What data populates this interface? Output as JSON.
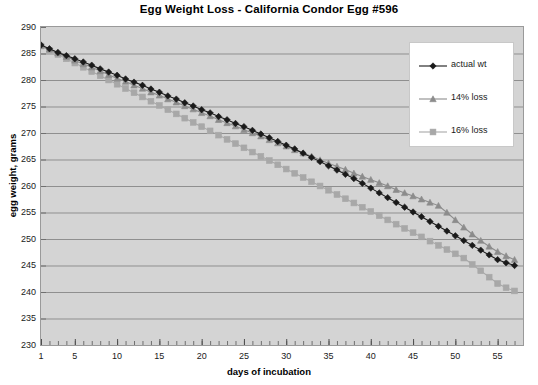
{
  "chart_data": {
    "type": "line",
    "title": "Egg Weight Loss - California Condor Egg #596",
    "xlabel": "days of incubation",
    "ylabel": "egg weight, grams",
    "xlim": [
      1,
      58
    ],
    "ylim": [
      230,
      290
    ],
    "xticks": [
      1,
      5,
      10,
      15,
      20,
      25,
      30,
      35,
      40,
      45,
      50,
      55
    ],
    "yticks": [
      230,
      235,
      240,
      245,
      250,
      255,
      260,
      265,
      270,
      275,
      280,
      285,
      290
    ],
    "grid": "horizontal",
    "legend_position": "upper-right",
    "x": [
      1,
      2,
      3,
      4,
      5,
      6,
      7,
      8,
      9,
      10,
      11,
      12,
      13,
      14,
      15,
      16,
      17,
      18,
      19,
      20,
      21,
      22,
      23,
      24,
      25,
      26,
      27,
      28,
      29,
      30,
      31,
      32,
      33,
      34,
      35,
      36,
      37,
      38,
      39,
      40,
      41,
      42,
      43,
      44,
      45,
      46,
      47,
      48,
      49,
      50,
      51,
      52,
      53,
      54,
      55,
      56,
      57
    ],
    "series": [
      {
        "name": "actual wt",
        "marker": "diamond",
        "color": "#1a1a1a",
        "values": [
          286.6,
          285.9,
          285.2,
          284.6,
          284.0,
          283.4,
          282.8,
          282.1,
          281.5,
          280.9,
          280.2,
          279.6,
          279.0,
          278.3,
          277.7,
          277.0,
          276.4,
          275.7,
          275.1,
          274.4,
          273.8,
          273.1,
          272.5,
          271.8,
          271.2,
          270.5,
          269.8,
          269.1,
          268.4,
          267.7,
          267.0,
          266.2,
          265.4,
          264.6,
          263.8,
          263.0,
          262.2,
          261.4,
          260.5,
          259.6,
          258.7,
          257.8,
          256.9,
          256.0,
          255.1,
          254.2,
          253.3,
          252.4,
          251.5,
          250.6,
          249.7,
          248.8,
          247.9,
          247.0,
          246.1,
          245.5,
          245.0
        ]
      },
      {
        "name": "14% loss",
        "marker": "triangle",
        "color": "#8c8c8c",
        "values": [
          286.5,
          285.8,
          285.1,
          284.4,
          283.7,
          283.0,
          282.4,
          281.7,
          281.0,
          280.3,
          279.7,
          279.0,
          278.4,
          277.7,
          277.1,
          276.4,
          275.8,
          275.1,
          274.5,
          273.8,
          273.2,
          272.5,
          271.9,
          271.3,
          270.6,
          270.0,
          269.4,
          268.7,
          268.1,
          267.5,
          266.8,
          266.2,
          265.6,
          264.9,
          264.3,
          263.7,
          263.1,
          262.4,
          261.8,
          261.2,
          260.6,
          260.0,
          259.3,
          258.7,
          258.1,
          257.5,
          256.9,
          256.3,
          255.0,
          253.6,
          252.2,
          250.9,
          249.7,
          248.6,
          247.6,
          246.8,
          246.1
        ]
      },
      {
        "name": "16% loss",
        "marker": "square",
        "color": "#a8a8a8",
        "values": [
          286.4,
          285.6,
          284.8,
          284.0,
          283.2,
          282.4,
          281.6,
          280.8,
          280.0,
          279.2,
          278.4,
          277.6,
          276.8,
          276.0,
          275.2,
          274.4,
          273.6,
          272.8,
          272.0,
          271.2,
          270.4,
          269.6,
          268.8,
          268.0,
          267.2,
          266.4,
          265.6,
          264.8,
          264.0,
          263.2,
          262.4,
          261.6,
          260.8,
          260.0,
          259.2,
          258.4,
          257.6,
          256.8,
          256.0,
          255.2,
          254.4,
          253.6,
          252.8,
          252.0,
          251.2,
          250.4,
          249.6,
          248.8,
          248.0,
          247.2,
          246.4,
          245.2,
          244.0,
          242.8,
          241.6,
          240.8,
          240.2
        ]
      }
    ]
  },
  "colors": {
    "plot_background": "#d4d4d4",
    "gridline": "#8f8f8f",
    "axis": "#7a7a7a",
    "legend_background": "#ffffff",
    "text": "#1a1a1a"
  }
}
